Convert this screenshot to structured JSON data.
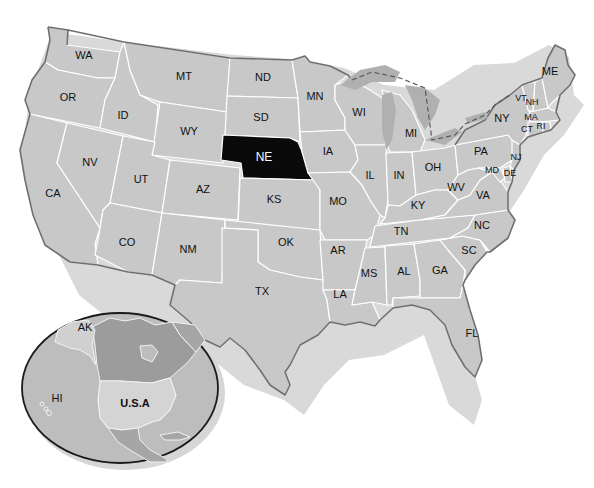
{
  "map": {
    "title": "United States",
    "highlighted_state": "NE",
    "colors": {
      "state_fill": "#c8c8c8",
      "highlight_fill": "#0a0a0a",
      "border": "#ffffff",
      "coastline": "#6e6e6e",
      "background": "#ffffff"
    },
    "states": [
      {
        "abbr": "WA"
      },
      {
        "abbr": "OR"
      },
      {
        "abbr": "CA"
      },
      {
        "abbr": "ID"
      },
      {
        "abbr": "NV"
      },
      {
        "abbr": "MT"
      },
      {
        "abbr": "WY"
      },
      {
        "abbr": "UT"
      },
      {
        "abbr": "AZ"
      },
      {
        "abbr": "CO"
      },
      {
        "abbr": "NM"
      },
      {
        "abbr": "ND"
      },
      {
        "abbr": "SD"
      },
      {
        "abbr": "NE"
      },
      {
        "abbr": "KS"
      },
      {
        "abbr": "OK"
      },
      {
        "abbr": "TX"
      },
      {
        "abbr": "MN"
      },
      {
        "abbr": "IA"
      },
      {
        "abbr": "MO"
      },
      {
        "abbr": "AR"
      },
      {
        "abbr": "LA"
      },
      {
        "abbr": "WI"
      },
      {
        "abbr": "IL"
      },
      {
        "abbr": "MI"
      },
      {
        "abbr": "IN"
      },
      {
        "abbr": "OH"
      },
      {
        "abbr": "KY"
      },
      {
        "abbr": "TN"
      },
      {
        "abbr": "MS"
      },
      {
        "abbr": "AL"
      },
      {
        "abbr": "GA"
      },
      {
        "abbr": "FL"
      },
      {
        "abbr": "SC"
      },
      {
        "abbr": "NC"
      },
      {
        "abbr": "VA"
      },
      {
        "abbr": "WV"
      },
      {
        "abbr": "MD"
      },
      {
        "abbr": "DE"
      },
      {
        "abbr": "PA"
      },
      {
        "abbr": "NJ"
      },
      {
        "abbr": "NY"
      },
      {
        "abbr": "CT"
      },
      {
        "abbr": "RI"
      },
      {
        "abbr": "MA"
      },
      {
        "abbr": "VT"
      },
      {
        "abbr": "NH"
      },
      {
        "abbr": "ME"
      }
    ]
  },
  "inset": {
    "labels": {
      "alaska": "AK",
      "hawaii": "HI",
      "usa": "U.S.A"
    }
  }
}
